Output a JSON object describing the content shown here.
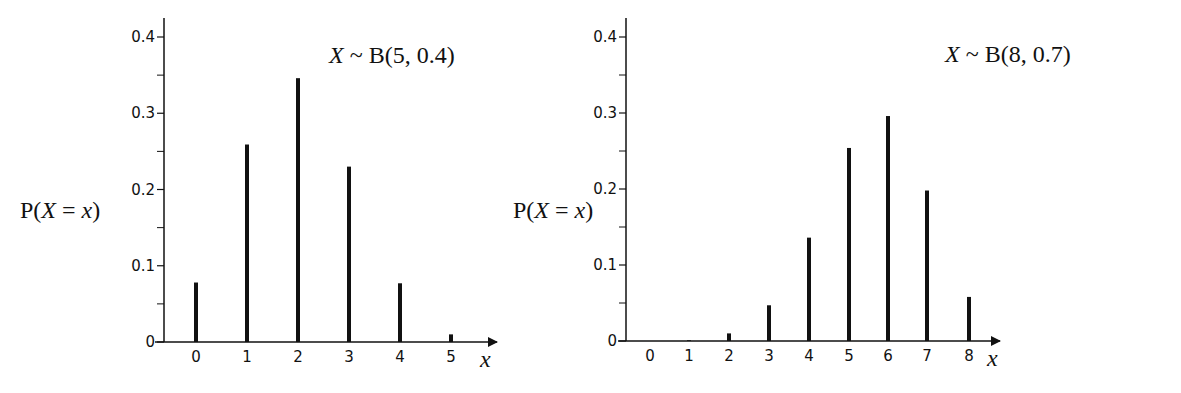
{
  "charts": [
    {
      "title": "X ~ B(5, 0.4)",
      "ylabel": "P(X = x)",
      "xlabel": "x",
      "yticks": [
        "0",
        "0.1",
        "0.2",
        "0.3",
        "0.4"
      ],
      "xticks": [
        "0",
        "1",
        "2",
        "3",
        "4",
        "5"
      ]
    },
    {
      "title": "X ~ B(8, 0.7)",
      "ylabel": "P(X = x)",
      "xlabel": "x",
      "yticks": [
        "0",
        "0.1",
        "0.2",
        "0.3",
        "0.4"
      ],
      "xticks": [
        "0",
        "1",
        "2",
        "3",
        "4",
        "5",
        "6",
        "7",
        "8"
      ]
    }
  ],
  "chart_data": [
    {
      "type": "bar",
      "title": "X ~ B(5, 0.4)",
      "xlabel": "x",
      "ylabel": "P(X = x)",
      "categories": [
        "0",
        "1",
        "2",
        "3",
        "4",
        "5"
      ],
      "values": [
        0.078,
        0.259,
        0.346,
        0.23,
        0.077,
        0.01
      ],
      "ylim": [
        0,
        0.4
      ],
      "yticks": [
        0,
        0.1,
        0.2,
        0.3,
        0.4
      ],
      "minor_yticks": [
        0.05,
        0.15,
        0.25,
        0.35
      ],
      "grid": false,
      "legend": null
    },
    {
      "type": "bar",
      "title": "X ~ B(8, 0.7)",
      "xlabel": "x",
      "ylabel": "P(X = x)",
      "categories": [
        "0",
        "1",
        "2",
        "3",
        "4",
        "5",
        "6",
        "7",
        "8"
      ],
      "values": [
        0.0,
        0.001,
        0.01,
        0.047,
        0.136,
        0.254,
        0.296,
        0.198,
        0.058
      ],
      "ylim": [
        0,
        0.4
      ],
      "yticks": [
        0,
        0.1,
        0.2,
        0.3,
        0.4
      ],
      "minor_yticks": [
        0.05,
        0.15,
        0.25,
        0.35
      ],
      "grid": false,
      "legend": null
    }
  ]
}
